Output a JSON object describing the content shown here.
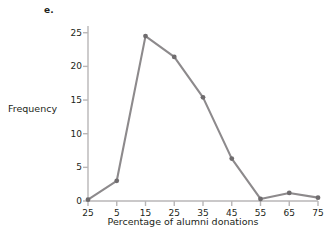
{
  "figure": {
    "panel_label": "e.",
    "y_axis_label": "Frequency",
    "x_axis_label": "Percentage of alumni donations"
  },
  "style": {
    "line_color": "#8d8a8c",
    "marker_color": "#6f6c6e",
    "axis_color": "#b8b6b7",
    "text_color": "#231f20",
    "background": "#ffffff"
  },
  "chart_data": {
    "type": "line",
    "title": "e.",
    "xlabel": "Percentage of alumni donations",
    "ylabel": "Frequency",
    "x": [
      -5,
      5,
      15,
      25,
      35,
      45,
      55,
      65,
      75
    ],
    "values": [
      0.2,
      3.0,
      24.5,
      21.4,
      15.4,
      6.3,
      0.3,
      1.2,
      0.5
    ],
    "xtick_labels": [
      "25",
      "5",
      "15",
      "25",
      "35",
      "45",
      "55",
      "65",
      "75"
    ],
    "ytick_labels": [
      "0",
      "5",
      "10",
      "15",
      "20",
      "25"
    ],
    "ytick_values": [
      0,
      5,
      10,
      15,
      20,
      25
    ],
    "xlim": [
      -5,
      75
    ],
    "ylim": [
      0,
      26
    ],
    "grid": false,
    "legend": false,
    "markers": true,
    "marker_shape": "circle"
  }
}
